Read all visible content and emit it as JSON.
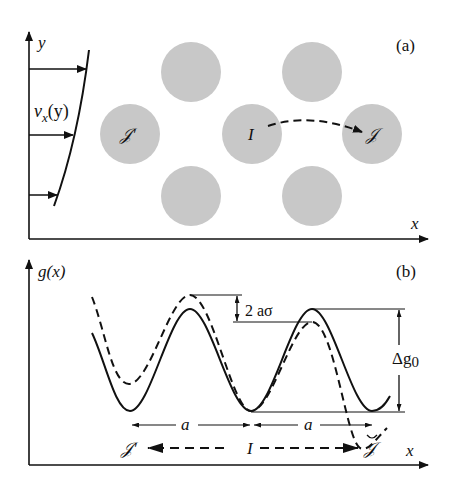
{
  "panel_a": {
    "tag": "(a)",
    "y_axis_label": "y",
    "x_axis_label": "x",
    "velocity_label_main": "v",
    "velocity_label_sub": "x",
    "velocity_label_arg": "(y)",
    "initial_site_label": "I",
    "final_site_label": "𝒥",
    "back_site_label": "𝒥'",
    "particle_color": "#c8c8c8"
  },
  "panel_b": {
    "tag": "(b)",
    "y_axis_label": "g(x)",
    "x_axis_label": "x",
    "stress_shift_label": "2 aσ",
    "barrier_label_main": "Δg",
    "barrier_label_sub": "0",
    "spacing_label_left": "a",
    "spacing_label_right": "a",
    "initial_label": "I",
    "forward_label": "𝒥",
    "backward_label": "𝒥'"
  }
}
